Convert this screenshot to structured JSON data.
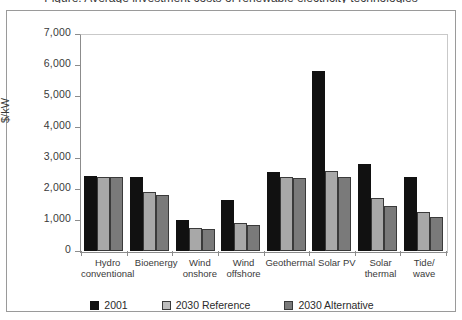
{
  "clipped_title": "Figure: Average investment costs of renewable electricity technologies",
  "chart_data": {
    "type": "bar",
    "title": "",
    "xlabel": "",
    "ylabel": "$/kW",
    "ylim": [
      0,
      7000
    ],
    "ytick_values": [
      7000,
      6000,
      5000,
      4000,
      3000,
      2000,
      1000,
      0
    ],
    "ytick_labels": [
      "7,000",
      "6,000",
      "5,000",
      "4,000",
      "3,000",
      "2,000",
      "1,000",
      "0"
    ],
    "grid": false,
    "legend_position": "bottom",
    "categories": [
      "Hydro conventional",
      "Bioenergy",
      "Wind onshore",
      "Wind offshore",
      "Geothermal",
      "Solar PV",
      "Solar thermal",
      "Tide/ wave"
    ],
    "category_lines": [
      [
        "Hydro",
        "conventional"
      ],
      [
        "Bioenergy",
        ""
      ],
      [
        "Wind",
        "onshore"
      ],
      [
        "Wind",
        "offshore"
      ],
      [
        "Geothermal",
        ""
      ],
      [
        "Solar PV",
        ""
      ],
      [
        "Solar",
        "thermal"
      ],
      [
        "Tide/",
        "wave"
      ]
    ],
    "series": [
      {
        "name": "2001",
        "color": "#111111",
        "values": [
          2430,
          2400,
          1000,
          1650,
          2550,
          5800,
          2800,
          2400
        ]
      },
      {
        "name": "2030 Reference",
        "color": "#a8a8a8",
        "values": [
          2400,
          1900,
          750,
          900,
          2400,
          2580,
          1700,
          1250
        ]
      },
      {
        "name": "2030 Alternative",
        "color": "#7a7a7a",
        "values": [
          2380,
          1800,
          700,
          850,
          2360,
          2400,
          1450,
          1100
        ]
      }
    ]
  }
}
